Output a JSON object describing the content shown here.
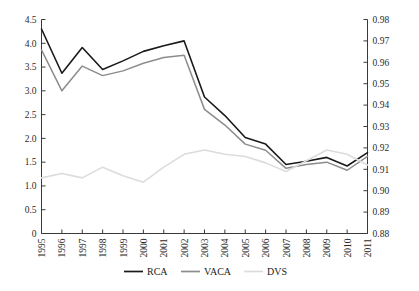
{
  "chart_data": {
    "type": "line",
    "title": "",
    "xlabel": "",
    "ylabel": "",
    "grid": false,
    "legend_position": "bottom-center",
    "categories": [
      "1995",
      "1996",
      "1997",
      "1998",
      "1999",
      "2000",
      "2001",
      "2002",
      "2003",
      "2004",
      "2005",
      "2006",
      "2007",
      "2008",
      "2009",
      "2010",
      "2011"
    ],
    "x": [
      1995,
      1996,
      1997,
      1998,
      1999,
      2000,
      2001,
      2002,
      2003,
      2004,
      2005,
      2006,
      2007,
      2008,
      2009,
      2010,
      2011
    ],
    "axes": {
      "left": {
        "ylim": [
          0,
          4.5
        ],
        "ticks": [
          0,
          0.5,
          1.0,
          1.5,
          2.0,
          2.5,
          3.0,
          3.5,
          4.0,
          4.5
        ],
        "tick_labels": [
          "0",
          "0.5",
          "1.0",
          "1.5",
          "2.0",
          "2.5",
          "3.0",
          "3.5",
          "4.0",
          "4.5"
        ]
      },
      "right": {
        "ylim": [
          0.88,
          0.98
        ],
        "ticks": [
          0.88,
          0.89,
          0.9,
          0.91,
          0.92,
          0.93,
          0.94,
          0.95,
          0.96,
          0.97,
          0.98
        ],
        "tick_labels": [
          "0.88",
          "0.89",
          "0.90",
          "0.91",
          "0.92",
          "0.93",
          "0.94",
          "0.95",
          "0.96",
          "0.97",
          "0.98"
        ]
      }
    },
    "series": [
      {
        "name": "RCA",
        "axis": "left",
        "color": "#1a1a1a",
        "width": 1.6,
        "values": [
          4.3,
          3.37,
          3.91,
          3.45,
          3.63,
          3.83,
          3.95,
          4.05,
          2.87,
          2.48,
          2.02,
          1.88,
          1.45,
          1.52,
          1.6,
          1.42,
          1.7
        ]
      },
      {
        "name": "VACA",
        "axis": "left",
        "color": "#8c8c8c",
        "width": 1.5,
        "values": [
          3.86,
          3.0,
          3.52,
          3.32,
          3.42,
          3.58,
          3.7,
          3.75,
          2.61,
          2.28,
          1.88,
          1.75,
          1.37,
          1.45,
          1.5,
          1.33,
          1.62
        ]
      },
      {
        "name": "DVS",
        "axis": "right",
        "color": "#dcdcdc",
        "width": 1.6,
        "values": [
          0.906,
          0.908,
          0.906,
          0.911,
          0.907,
          0.904,
          0.911,
          0.917,
          0.919,
          0.917,
          0.916,
          0.913,
          0.909,
          0.914,
          0.919,
          0.917,
          0.912
        ]
      }
    ]
  },
  "legend": {
    "items": [
      {
        "label": "RCA",
        "color": "#1a1a1a"
      },
      {
        "label": "VACA",
        "color": "#8c8c8c"
      },
      {
        "label": "DVS",
        "color": "#dcdcdc"
      }
    ]
  }
}
